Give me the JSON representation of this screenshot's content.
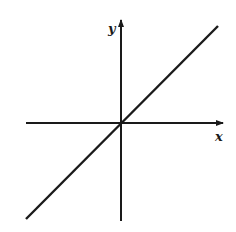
{
  "diagram": {
    "title": "",
    "x_axis_label": "x",
    "y_axis_label": "y",
    "line_description": "straight line through the origin with positive slope (y = x)",
    "colors": {
      "ink": "#1a1a1a",
      "background": "#ffffff"
    }
  }
}
